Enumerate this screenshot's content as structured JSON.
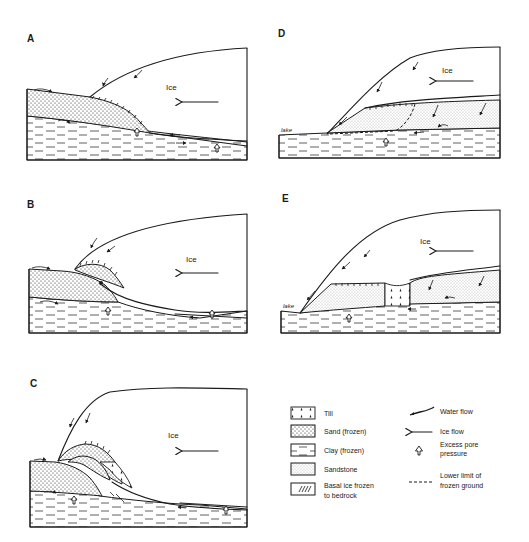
{
  "figure": {
    "panels": [
      {
        "id": "A",
        "label": "A",
        "ice_label": "Ice"
      },
      {
        "id": "B",
        "label": "B",
        "ice_label": "Ice"
      },
      {
        "id": "C",
        "label": "C",
        "ice_label": "Ice"
      },
      {
        "id": "D",
        "label": "D",
        "ice_label": "Ice",
        "lake_label": "lake"
      },
      {
        "id": "E",
        "label": "E",
        "ice_label": "Ice",
        "lake_label": "lake"
      }
    ],
    "legend": {
      "materials": [
        {
          "symbol": "till",
          "label": "Till"
        },
        {
          "symbol": "sand-frozen",
          "label": "Sand (frozen)"
        },
        {
          "symbol": "clay-frozen",
          "label": "Clay (frozen)"
        },
        {
          "symbol": "sandstone",
          "label": "Sandstone"
        },
        {
          "symbol": "basal-ice",
          "label_line1": "Basal ice frozen",
          "label_line2": "to bedrock"
        }
      ],
      "processes": [
        {
          "symbol": "water-flow",
          "label": "Water flow"
        },
        {
          "symbol": "ice-flow",
          "label": "Ice flow"
        },
        {
          "symbol": "excess-pore-pressure",
          "label_line1": "Excess pore",
          "label_line2": "pressure"
        },
        {
          "symbol": "lower-limit-frozen-ground",
          "label_line1": "Lower limit of",
          "label_line2": "frozen ground"
        }
      ]
    },
    "colors": {
      "ink": "#1a1a1a",
      "background": "#ffffff"
    }
  }
}
